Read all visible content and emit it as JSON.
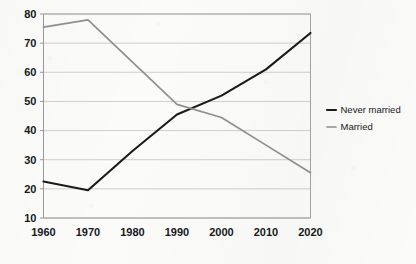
{
  "chart_data": {
    "type": "line",
    "title": "",
    "subtitle": "",
    "xlabel": "",
    "ylabel": "",
    "x": [
      1960,
      1970,
      1980,
      1990,
      2000,
      2010,
      2020
    ],
    "xtick_labels": [
      "1960",
      "1970",
      "1980",
      "1990",
      "2000",
      "2010",
      "2020"
    ],
    "ytick_labels": [
      "10",
      "20",
      "30",
      "40",
      "50",
      "60",
      "70",
      "80"
    ],
    "ytick_values": [
      10,
      20,
      30,
      40,
      50,
      60,
      70,
      80
    ],
    "xlim": [
      1960,
      2020
    ],
    "ylim": [
      10,
      80
    ],
    "grid": "horizontal",
    "legend_position": "right",
    "series": [
      {
        "name": "Never married",
        "color": "#1a1a1a",
        "values": [
          22.5,
          19.5,
          33.0,
          45.5,
          52.0,
          61.0,
          73.5
        ]
      },
      {
        "name": "Married",
        "color": "#8f8f8f",
        "values": [
          75.5,
          78.0,
          63.5,
          49.0,
          44.5,
          35.0,
          25.5
        ]
      }
    ],
    "annotations": []
  },
  "legend": {
    "items": [
      {
        "label": "Never married",
        "color": "#1a1a1a"
      },
      {
        "label": "Married",
        "color": "#8f8f8f"
      }
    ]
  },
  "axes": {
    "frame_color": "#9a9a9a",
    "gridline_color": "#c9c9c9"
  }
}
